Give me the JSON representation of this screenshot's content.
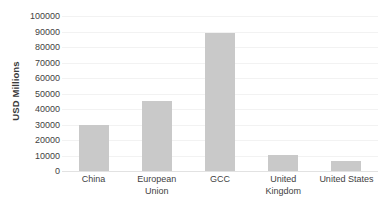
{
  "chart_data": {
    "type": "bar",
    "title": "",
    "xlabel": "",
    "ylabel": "USD Millions",
    "categories": [
      "China",
      "European Union",
      "GCC",
      "United Kingdom",
      "United States"
    ],
    "values": [
      30000,
      45000,
      89000,
      10500,
      6500
    ],
    "ylim": [
      0,
      100000
    ],
    "y_ticks": [
      100000,
      90000,
      80000,
      70000,
      60000,
      50000,
      40000,
      30000,
      20000,
      10000,
      0
    ],
    "y_tick_labels": [
      "100000",
      "90000",
      "80000",
      "70000",
      "60000",
      "50000",
      "40000",
      "30000",
      "20000",
      "10000",
      "0"
    ],
    "grid": true,
    "legend": false,
    "legend_position": "none",
    "series": [
      {
        "name": "USD Millions",
        "values": [
          30000,
          45000,
          89000,
          10500,
          6500
        ]
      }
    ],
    "colors": {
      "bar_fill": "#c9c9c9",
      "gridline": "#f2f2f2",
      "baseline": "#e2e2e2",
      "tick_text": "#3f3f3f",
      "axis_title_text": "#3a3a3a",
      "background": "#ffffff"
    }
  }
}
